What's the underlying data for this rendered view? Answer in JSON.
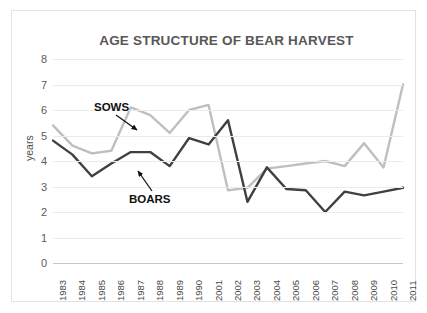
{
  "chart_data": {
    "type": "line",
    "title": "AGE STRUCTURE OF BEAR HARVEST",
    "xlabel": "",
    "ylabel": "years",
    "ylim": [
      0,
      8
    ],
    "yticks": [
      8,
      7,
      6,
      5,
      4,
      3,
      2,
      1,
      0
    ],
    "grid": true,
    "legend": "none (inline annotations)",
    "categories": [
      "1983",
      "1984",
      "1985",
      "1986",
      "1987",
      "1988",
      "1989",
      "1990",
      "2001",
      "2002",
      "2003",
      "2004",
      "2005",
      "2006",
      "2007",
      "2008",
      "2009",
      "2010",
      "2011"
    ],
    "series": [
      {
        "name": "SOWS",
        "color": "#bfbfbf",
        "values": [
          5.4,
          4.6,
          4.3,
          4.4,
          6.1,
          5.8,
          5.1,
          6.0,
          6.2,
          2.85,
          2.95,
          3.7,
          3.8,
          3.9,
          4.0,
          3.8,
          4.7,
          3.75,
          7.0
        ]
      },
      {
        "name": "BOARS",
        "color": "#404040",
        "values": [
          4.8,
          4.25,
          3.4,
          3.9,
          4.35,
          4.35,
          3.8,
          4.9,
          4.65,
          5.6,
          2.4,
          3.75,
          2.9,
          2.85,
          2.0,
          2.8,
          2.65,
          2.8,
          2.95
        ]
      }
    ],
    "annotations": [
      {
        "text": "SOWS",
        "points_to_series": "SOWS",
        "points_to_category": "1987"
      },
      {
        "text": "BOARS",
        "points_to_series": "BOARS",
        "points_to_category": "1987"
      }
    ]
  },
  "colors": {
    "title": "#575757",
    "gridline": "#eceaea",
    "axis": "#c9c7c7",
    "sows": "#bfbfbf",
    "boars": "#404040",
    "annotation": "#111111",
    "card_border": "#e2e2e2",
    "background": "#ffffff"
  }
}
